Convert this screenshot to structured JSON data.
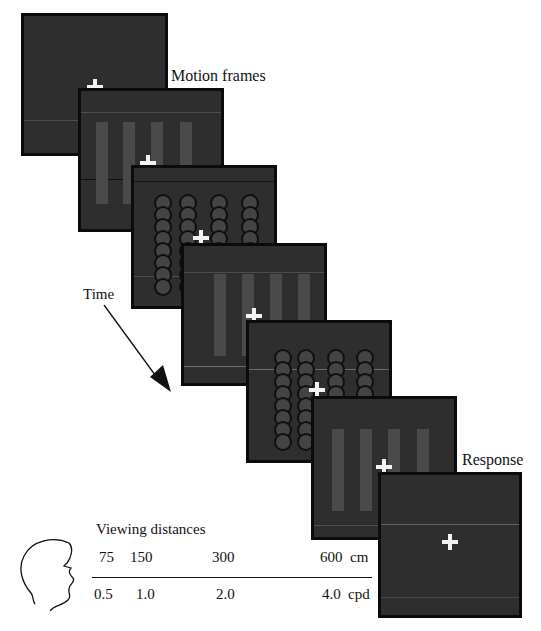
{
  "labels": {
    "motion_frames": "Motion frames",
    "time": "Time",
    "response": "Response",
    "viewing_distances": "Viewing distances"
  },
  "frames": [
    {
      "id": 1,
      "type": "blank-fixation",
      "fixation": "+"
    },
    {
      "id": 2,
      "type": "grating-bars",
      "fixation": "+"
    },
    {
      "id": 3,
      "type": "dot-columns",
      "fixation": "+"
    },
    {
      "id": 4,
      "type": "grating-bars",
      "fixation": "+"
    },
    {
      "id": 5,
      "type": "dot-columns",
      "fixation": "+"
    },
    {
      "id": 6,
      "type": "grating-bars",
      "fixation": "+"
    },
    {
      "id": 7,
      "type": "response-fixation",
      "fixation": "+"
    }
  ],
  "viewing_scale": {
    "distances_cm": [
      "75",
      "150",
      "300",
      "600"
    ],
    "distance_unit": "cm",
    "spatial_freq_cpd": [
      "0.5",
      "1.0",
      "2.0",
      "4.0"
    ],
    "freq_unit": "cpd"
  },
  "colors": {
    "frame_bg": "#2e2e2e",
    "frame_border": "#0b0b0b",
    "fixation": "#f2f2f2",
    "bar": "#4a4a4a"
  }
}
